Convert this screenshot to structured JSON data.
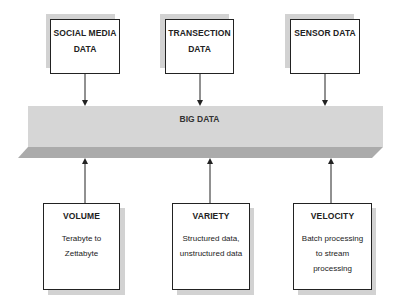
{
  "diagram": {
    "central": {
      "label": "BIG DATA"
    },
    "sources": [
      {
        "label": "SOCIAL MEDIA DATA"
      },
      {
        "label": "TRANSECTION DATA"
      },
      {
        "label": "SENSOR DATA"
      }
    ],
    "characteristics": [
      {
        "title": "VOLUME",
        "description": "Terabyte to Zettabyte"
      },
      {
        "title": "VARIETY",
        "description": "Structured data, unstructured data"
      },
      {
        "title": "VELOCITY",
        "description": "Batch processing to stream processing"
      }
    ],
    "colors": {
      "band_top": "#d4d4d4",
      "band_front": "#a9a9a9",
      "box_border": "#222222",
      "shadow": "#d2d2d2"
    }
  }
}
